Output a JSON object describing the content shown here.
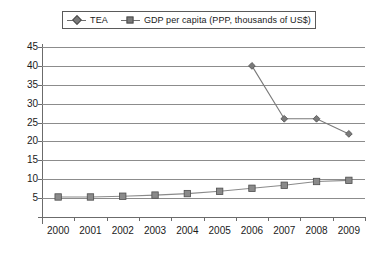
{
  "chart_data": {
    "type": "line",
    "title": "",
    "xlabel": "",
    "ylabel": "",
    "grid": "horizontal",
    "legend_position": "top",
    "x": [
      "2000",
      "2001",
      "2002",
      "2003",
      "2004",
      "2005",
      "2006",
      "2007",
      "2008",
      "2009"
    ],
    "ylim": [
      0,
      45
    ],
    "yticks": [
      "5",
      "10",
      "15",
      "20",
      "25",
      "30",
      "35",
      "40",
      "45"
    ],
    "series": [
      {
        "name": "TEA",
        "marker": "diamond",
        "color": "#7a7a7a",
        "values": [
          null,
          null,
          null,
          null,
          null,
          null,
          40,
          26,
          26,
          22
        ]
      },
      {
        "name": "GDP per capita (PPP, thousands of US$)",
        "marker": "square",
        "color": "#8a8a8a",
        "values": [
          5.3,
          5.3,
          5.5,
          5.8,
          6.2,
          6.8,
          7.6,
          8.4,
          9.4,
          9.7
        ]
      }
    ]
  },
  "legend": {
    "entries": [
      {
        "label": "TEA",
        "marker": "diamond"
      },
      {
        "label": "GDP per capita (PPP, thousands of US$)",
        "marker": "square"
      }
    ]
  }
}
